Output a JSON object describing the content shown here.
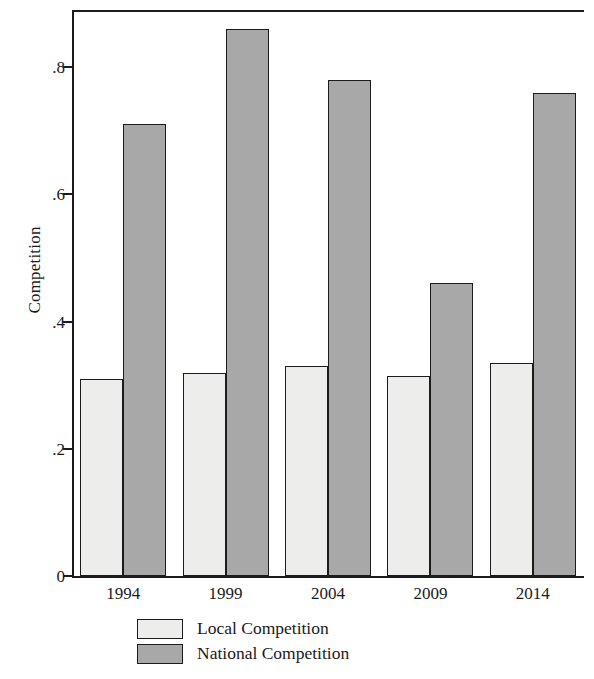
{
  "chart_data": {
    "type": "bar",
    "title": "",
    "xlabel": "",
    "ylabel": "Competition",
    "categories": [
      "1994",
      "1999",
      "2004",
      "2009",
      "2014"
    ],
    "series": [
      {
        "name": "Local Competition",
        "color": "#ededeb",
        "values": [
          0.31,
          0.32,
          0.33,
          0.315,
          0.335
        ]
      },
      {
        "name": "National Competition",
        "color": "#a8a8a8",
        "values": [
          0.71,
          0.86,
          0.78,
          0.46,
          0.76
        ]
      }
    ],
    "ylim": [
      0,
      0.89
    ],
    "yticks": [
      0,
      0.2,
      0.4,
      0.6,
      0.8
    ],
    "ytick_labels": [
      "0",
      ".2",
      ".4",
      ".6",
      ".8"
    ],
    "grid": false,
    "legend_position": "bottom"
  },
  "legend": {
    "items": [
      {
        "label": "Local Competition",
        "swatch": "local-swatch"
      },
      {
        "label": "National Competition",
        "swatch": "national-swatch"
      }
    ]
  }
}
